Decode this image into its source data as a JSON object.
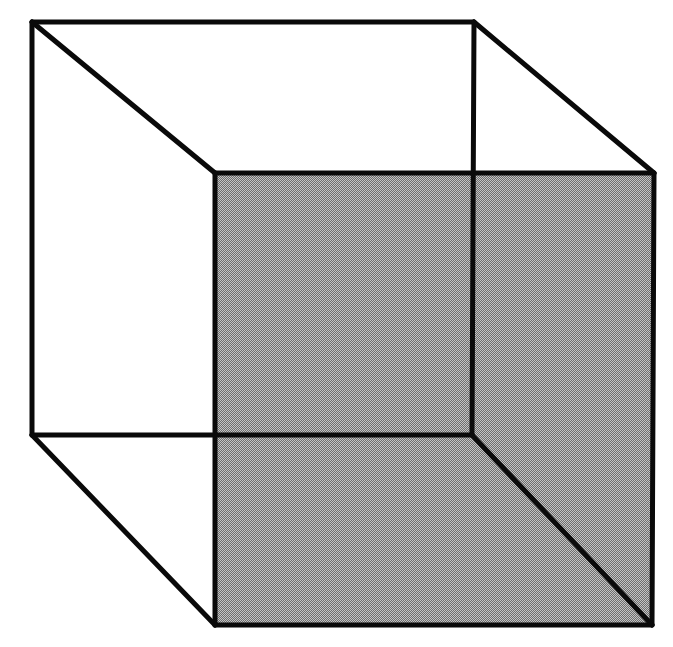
{
  "figure": {
    "width": 673,
    "height": 647,
    "colors": {
      "background": "#ffffff",
      "edge": "#0a0a0a",
      "shade_light": "#c4c4c4",
      "shade_dark": "#6e6e6e",
      "shade_mean": "#9a9a9a"
    },
    "vertices": {
      "back_top_left": [
        32,
        22
      ],
      "back_top_right": [
        474,
        22
      ],
      "back_bottom_left": [
        32,
        435
      ],
      "back_bottom_right": [
        472,
        435
      ],
      "front_top_left": [
        215,
        173
      ],
      "front_top_right": [
        654,
        173
      ],
      "front_bottom_left": [
        215,
        625
      ],
      "front_bottom_right": [
        652,
        625
      ]
    },
    "shaded_face": "front"
  }
}
